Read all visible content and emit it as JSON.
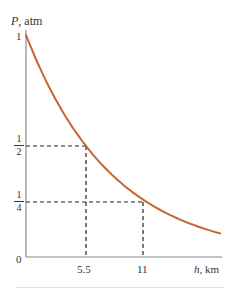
{
  "chart_data": {
    "type": "line",
    "title": "",
    "xlabel": "h, km",
    "ylabel": "P, atm",
    "xlim": [
      0,
      17.8
    ],
    "ylim": [
      0,
      1
    ],
    "x_ticks": [
      "5.5",
      "11"
    ],
    "y_ticks": [
      "0",
      "1/4",
      "1/2",
      "1"
    ],
    "grid": false,
    "legend": null,
    "series": [
      {
        "name": "P(h) = 2^(-h/5.5)",
        "color": "#c8652e",
        "x": [
          0,
          1,
          2,
          3,
          4,
          5,
          5.5,
          6,
          7,
          8,
          9,
          10,
          11,
          12,
          13,
          14,
          15,
          16,
          17,
          17.8
        ],
        "values": [
          1.0,
          0.882,
          0.777,
          0.685,
          0.604,
          0.533,
          0.5,
          0.469,
          0.414,
          0.365,
          0.322,
          0.284,
          0.25,
          0.221,
          0.194,
          0.171,
          0.151,
          0.133,
          0.117,
          0.106
        ]
      }
    ],
    "annotations": [
      {
        "type": "dashed-guide",
        "x": 5.5,
        "y": 0.5,
        "label": "half pressure at 5.5 km"
      },
      {
        "type": "dashed-guide",
        "x": 11,
        "y": 0.25,
        "label": "quarter pressure at 11 km"
      }
    ]
  },
  "labels": {
    "y_axis": "P, atm",
    "x_axis": "h, km",
    "y_one": "1",
    "y_zero": "0",
    "y_half_num": "1",
    "y_half_den": "2",
    "y_quarter_num": "1",
    "y_quarter_den": "4",
    "x_tick_1": "5.5",
    "x_tick_2": "11"
  },
  "colors": {
    "curve": "#c8652e",
    "axis": "#888888",
    "guide": "#222222"
  }
}
